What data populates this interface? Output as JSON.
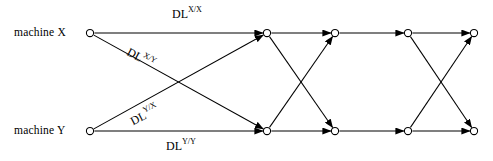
{
  "figure": {
    "name": "delay-line-butterfly-network",
    "width": 493,
    "height": 161,
    "background": "#ffffff",
    "line_color": "#000000"
  },
  "sources": [
    {
      "id": "machine-x",
      "label": "machine X",
      "node_x": 90,
      "node_y": 33,
      "label_x": 14,
      "label_y": 26
    },
    {
      "id": "machine-y",
      "label": "machine Y",
      "node_x": 90,
      "node_y": 131,
      "label_x": 14,
      "label_y": 124
    }
  ],
  "edge_labels": [
    {
      "id": "dl-xx",
      "base": "DL",
      "sup": "X/X",
      "x": 172,
      "y": 6,
      "rotation": "none"
    },
    {
      "id": "dl-xy",
      "base": "DL",
      "sup": "X/Y",
      "x": 124,
      "y": 42,
      "rotation": "down"
    },
    {
      "id": "dl-yx",
      "base": "DL",
      "sup": "Y/X",
      "x": 135,
      "y": 113,
      "rotation": "up"
    },
    {
      "id": "dl-yy",
      "base": "DL",
      "sup": "Y/Y",
      "x": 166,
      "y": 138,
      "rotation": "none"
    }
  ],
  "stages": {
    "columns_x": [
      267,
      335,
      408,
      474
    ],
    "row_top_y": 33,
    "row_bottom_y": 131,
    "node_radius": 3.6,
    "node_fill": "#ffffff",
    "node_stroke": "#000000"
  },
  "nodes": [
    {
      "id": "n-t1",
      "row": "top",
      "stage": 1,
      "x": 267,
      "y": 33
    },
    {
      "id": "n-t2",
      "row": "top",
      "stage": 2,
      "x": 335,
      "y": 33
    },
    {
      "id": "n-t3",
      "row": "top",
      "stage": 3,
      "x": 408,
      "y": 33
    },
    {
      "id": "n-t4",
      "row": "top",
      "stage": 4,
      "x": 474,
      "y": 33
    },
    {
      "id": "n-b1",
      "row": "bottom",
      "stage": 1,
      "x": 267,
      "y": 131
    },
    {
      "id": "n-b2",
      "row": "bottom",
      "stage": 2,
      "x": 335,
      "y": 131
    },
    {
      "id": "n-b3",
      "row": "bottom",
      "stage": 3,
      "x": 408,
      "y": 131
    },
    {
      "id": "n-b4",
      "row": "bottom",
      "stage": 4,
      "x": 474,
      "y": 131
    }
  ],
  "edges": [
    {
      "id": "e-x-t1",
      "from": "machine-x",
      "to": "n-t1",
      "kind": "straight",
      "label": "dl-xx"
    },
    {
      "id": "e-x-b1",
      "from": "machine-x",
      "to": "n-b1",
      "kind": "cross",
      "label": "dl-xy"
    },
    {
      "id": "e-y-t1",
      "from": "machine-y",
      "to": "n-t1",
      "kind": "cross",
      "label": "dl-yx"
    },
    {
      "id": "e-y-b1",
      "from": "machine-y",
      "to": "n-b1",
      "kind": "straight",
      "label": "dl-yy"
    },
    {
      "id": "e-t1-t2",
      "from": "n-t1",
      "to": "n-t2",
      "kind": "straight",
      "label": ""
    },
    {
      "id": "e-t1-b2",
      "from": "n-t1",
      "to": "n-b2",
      "kind": "cross",
      "label": ""
    },
    {
      "id": "e-b1-t2",
      "from": "n-b1",
      "to": "n-t2",
      "kind": "cross",
      "label": ""
    },
    {
      "id": "e-b1-b2",
      "from": "n-b1",
      "to": "n-b2",
      "kind": "straight",
      "label": ""
    },
    {
      "id": "e-t2-t3",
      "from": "n-t2",
      "to": "n-t3",
      "kind": "straight",
      "label": ""
    },
    {
      "id": "e-b2-b3",
      "from": "n-b2",
      "to": "n-b3",
      "kind": "straight",
      "label": ""
    },
    {
      "id": "e-t3-t4",
      "from": "n-t3",
      "to": "n-t4",
      "kind": "straight",
      "label": ""
    },
    {
      "id": "e-t3-b4",
      "from": "n-t3",
      "to": "n-b4",
      "kind": "cross",
      "label": ""
    },
    {
      "id": "e-b3-t4",
      "from": "n-b3",
      "to": "n-t4",
      "kind": "cross",
      "label": ""
    },
    {
      "id": "e-b3-b4",
      "from": "n-b3",
      "to": "n-b4",
      "kind": "straight",
      "label": ""
    }
  ]
}
